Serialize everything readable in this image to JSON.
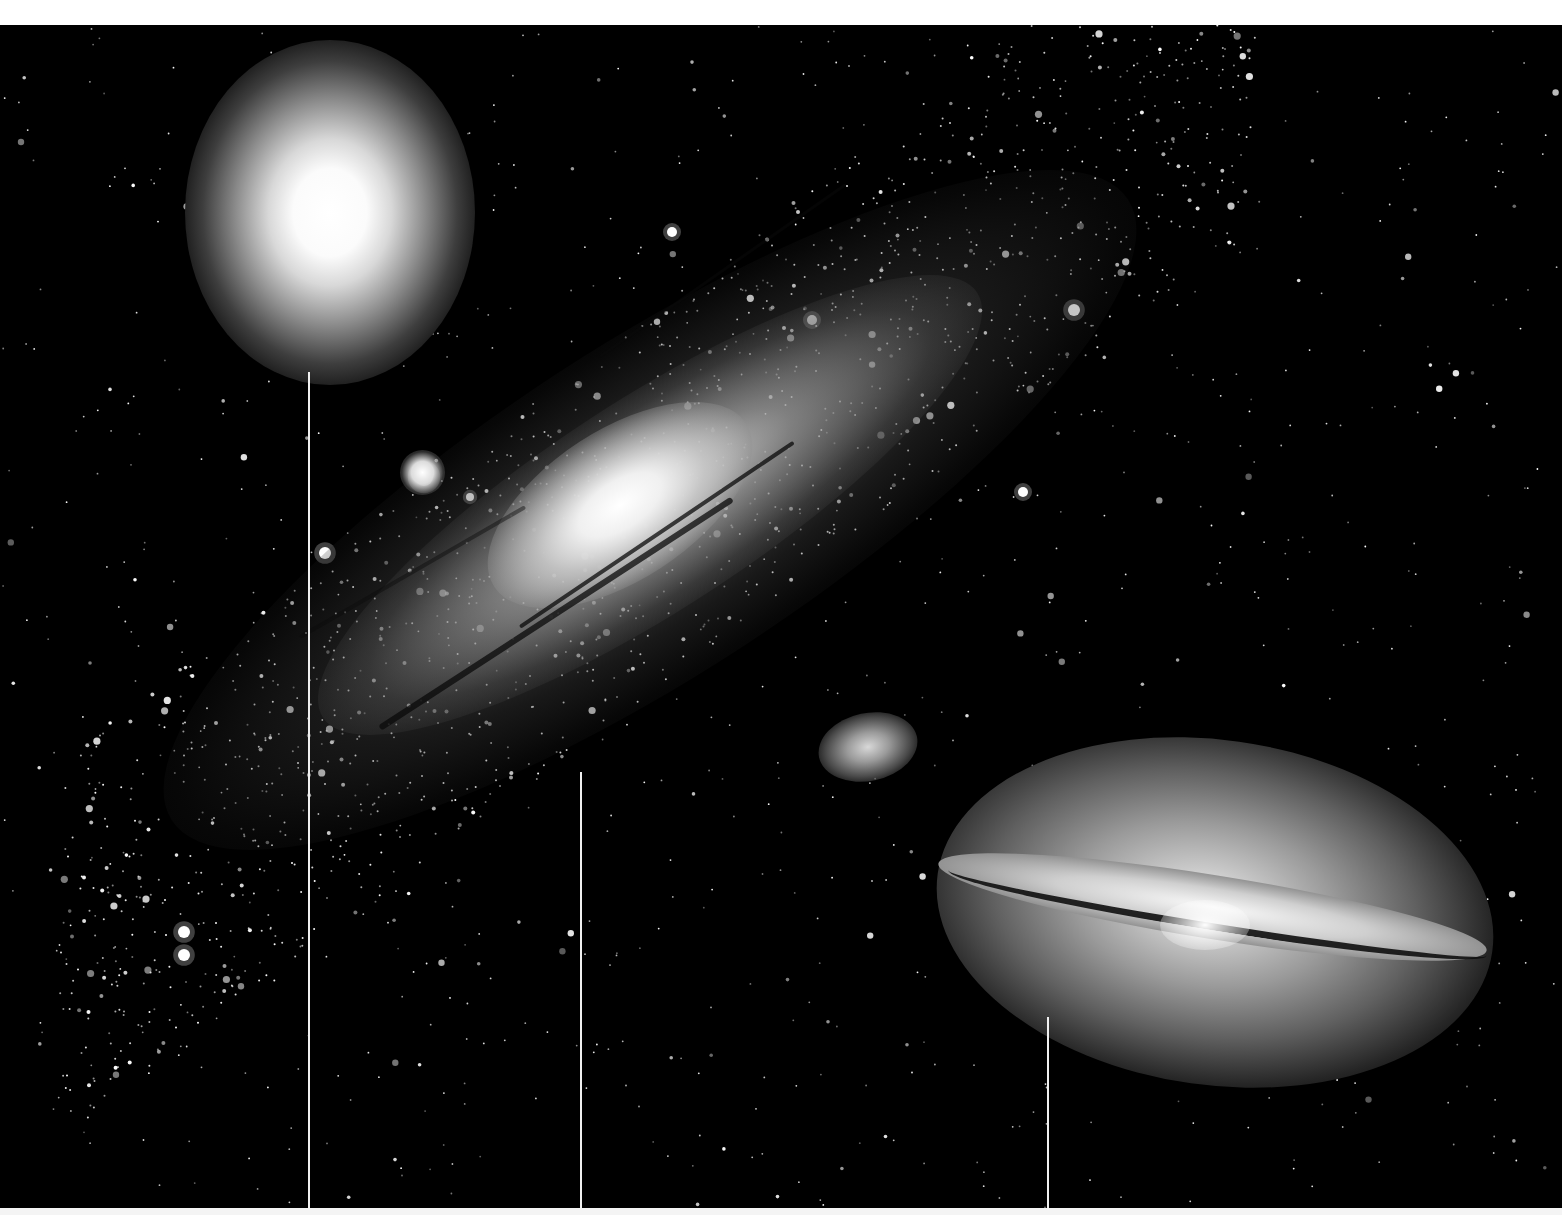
{
  "image": {
    "kind": "astronomical-photograph",
    "background_color": "#000000",
    "frame_color": "#ffffff",
    "objects": [
      {
        "name": "elliptical-galaxy",
        "position": "top-left",
        "shape": "round diffuse glow"
      },
      {
        "name": "spiral-galaxy",
        "position": "center, diagonal",
        "shape": "large inclined spiral with dust lanes"
      },
      {
        "name": "satellite-galaxy",
        "position": "center-right",
        "shape": "small elliptical smudge"
      },
      {
        "name": "sombrero-galaxy",
        "position": "bottom-right",
        "shape": "edge-on spiral with dark dust lane and bright bulge"
      }
    ],
    "pointer_lines": [
      {
        "x": 309,
        "top": 372,
        "bottom": 1208
      },
      {
        "x": 581,
        "top": 772,
        "bottom": 1208
      },
      {
        "x": 1048,
        "top": 1017,
        "bottom": 1208
      }
    ]
  }
}
